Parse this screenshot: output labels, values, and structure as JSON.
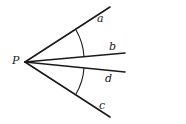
{
  "diagram": {
    "title": "",
    "stroke_color": "#1a1a1a",
    "background": "#ffffff",
    "vertex": {
      "label": "P",
      "x": 25,
      "y": 62
    },
    "rays": [
      {
        "label": "a",
        "x2": 110,
        "y2": 7
      },
      {
        "label": "b",
        "x2": 125,
        "y2": 53
      },
      {
        "label": "d",
        "x2": 125,
        "y2": 72
      },
      {
        "label": "c",
        "x2": 110,
        "y2": 117
      }
    ],
    "arcs": [
      {
        "between": [
          "a",
          "b"
        ],
        "description": "angle arc between rays a and b"
      },
      {
        "between": [
          "d",
          "c"
        ],
        "description": "angle arc between rays d and c"
      }
    ]
  },
  "labels": {
    "P": "P",
    "a": "a",
    "b": "b",
    "d": "d",
    "c": "c"
  }
}
